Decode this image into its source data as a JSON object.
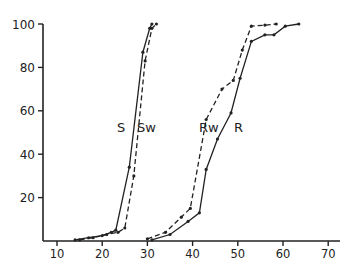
{
  "chart_data": {
    "type": "line",
    "title": "",
    "xlabel": "",
    "ylabel": "",
    "xlim": [
      7,
      72
    ],
    "ylim": [
      0,
      100
    ],
    "grid": false,
    "x_ticks": [
      10,
      20,
      30,
      40,
      50,
      60,
      70
    ],
    "y_ticks": [
      20,
      40,
      60,
      80,
      100
    ],
    "series": [
      {
        "name": "S",
        "style": "solid",
        "x": [
          14,
          17,
          20,
          22,
          23,
          26,
          29,
          30.5,
          31
        ],
        "y": [
          0.5,
          1.5,
          2.5,
          4,
          5,
          34,
          87,
          98,
          100
        ]
      },
      {
        "name": "Sw",
        "style": "dashed",
        "x": [
          15,
          18,
          21,
          23.5,
          25,
          27,
          29.5,
          31,
          32
        ],
        "y": [
          0.5,
          1.5,
          3,
          4,
          6,
          30,
          83,
          98,
          100
        ]
      },
      {
        "name": "Rw",
        "style": "dashed",
        "x": [
          30,
          34,
          37.5,
          39.5,
          43,
          46.5,
          49,
          51,
          53,
          56,
          58.5
        ],
        "y": [
          1,
          4,
          11,
          15,
          56,
          70,
          74,
          88,
          99,
          99.5,
          100
        ]
      },
      {
        "name": "R",
        "style": "solid",
        "x": [
          31,
          35,
          39,
          41.5,
          43,
          45.5,
          48.5,
          50.5,
          53,
          56,
          58,
          60.5,
          63.5
        ],
        "y": [
          0.5,
          3,
          9,
          13,
          33,
          47,
          59,
          75,
          92,
          95,
          95,
          99,
          100
        ]
      }
    ],
    "annotations": [
      {
        "text": "S",
        "x": 24.5,
        "y": 50
      },
      {
        "text": "Sw",
        "x": 30,
        "y": 50
      },
      {
        "text": "Rw",
        "x": 40,
        "y": 50
      },
      {
        "text": "R",
        "x": 50,
        "y": 50
      }
    ]
  }
}
